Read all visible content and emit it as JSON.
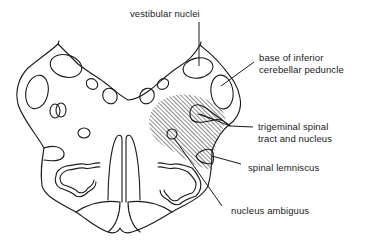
{
  "figure": {
    "labels": [
      {
        "id": "vestibular",
        "text": "vestibular nuclei"
      },
      {
        "id": "icp",
        "line1": "base of inferior",
        "line2": "cerebellar peduncle"
      },
      {
        "id": "trigeminal",
        "line1": "trigeminal spinal",
        "line2": "tract and nucleus"
      },
      {
        "id": "lemniscus",
        "text": "spinal lemniscus"
      },
      {
        "id": "ambiguus",
        "text": "nucleus ambiguus"
      }
    ],
    "shaded_region": "hatched lateral medullary area (infarct territory)",
    "colors": {
      "ink": "#1a1a1a",
      "background": "#ffffff"
    }
  }
}
